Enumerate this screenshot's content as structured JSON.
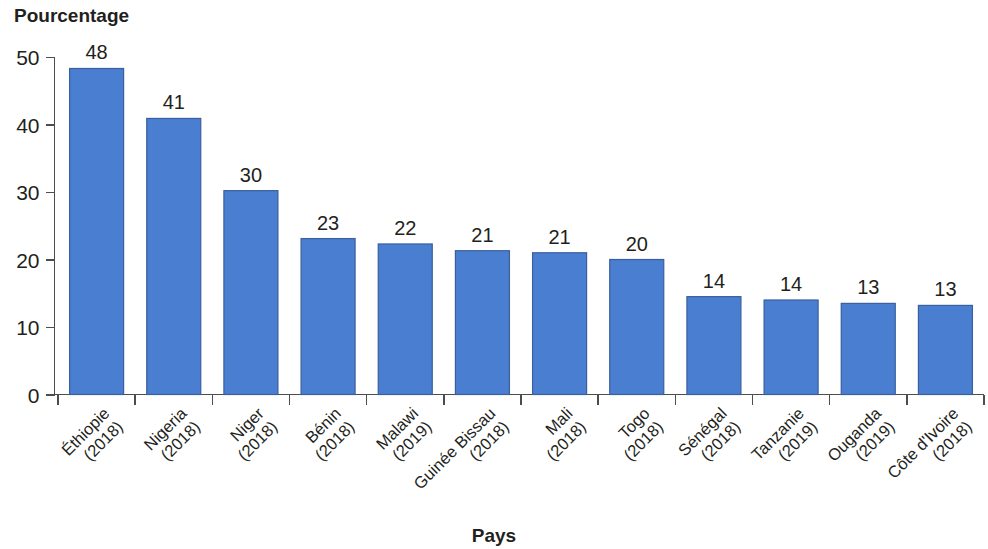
{
  "chart_data": {
    "type": "bar",
    "title": "",
    "ylabel": "Pourcentage",
    "xlabel": "Pays",
    "ylim": [
      0,
      50
    ],
    "yticks": [
      0,
      10,
      20,
      30,
      40,
      50
    ],
    "ytick_labels": [
      "0",
      "10",
      "20",
      "30",
      "40",
      "50"
    ],
    "grid": false,
    "legend": null,
    "bar_color": "#4a7ed0",
    "bar_border_color": "#3a5f9e",
    "axis_color": "#4d4d4d",
    "categories": [
      "Éthiopie\n(2018)",
      "Nigeria\n(2018)",
      "Niger\n(2018)",
      "Bénin\n(2018)",
      "Malawi\n(2019)",
      "Guinée Bissau\n(2018)",
      "Mali\n(2018)",
      "Togo\n(2018)",
      "Sénégal\n(2018)",
      "Tanzanie\n(2019)",
      "Ouganda\n(2019)",
      "Côte d'Ivoire\n(2018)"
    ],
    "category_names": [
      "Éthiopie",
      "Nigeria",
      "Niger",
      "Bénin",
      "Malawi",
      "Guinée Bissau",
      "Mali",
      "Togo",
      "Sénégal",
      "Tanzanie",
      "Ouganda",
      "Côte d'Ivoire"
    ],
    "category_years": [
      "(2018)",
      "(2018)",
      "(2018)",
      "(2018)",
      "(2019)",
      "(2018)",
      "(2018)",
      "(2018)",
      "(2018)",
      "(2019)",
      "(2019)",
      "(2018)"
    ],
    "values": [
      48,
      41,
      30,
      23,
      22,
      21,
      21,
      20,
      14,
      14,
      13,
      13
    ],
    "bar_heights": [
      48.3,
      40.9,
      30.2,
      23.1,
      22.3,
      21.3,
      21.0,
      20.0,
      14.5,
      14.0,
      13.5,
      13.2
    ],
    "value_labels": [
      "48",
      "41",
      "30",
      "23",
      "22",
      "21",
      "21",
      "20",
      "14",
      "14",
      "13",
      "13"
    ]
  }
}
